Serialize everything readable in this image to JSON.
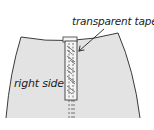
{
  "labels": {
    "tape": "transparent tape",
    "side": "right side"
  },
  "colors": {
    "fabric_fill": "#e3e3e3",
    "outline": "#3a3a3a",
    "tape_fill": "#f4f4f4",
    "text": "#222222"
  },
  "icons": {
    "arrow": "arrow-pointing-to-tape"
  }
}
